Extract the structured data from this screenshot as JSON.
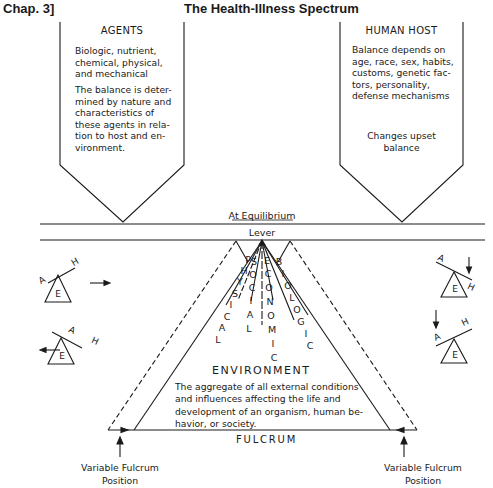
{
  "header": {
    "chapter": "Chap. 3]",
    "title": "The Health-Illness Spectrum"
  },
  "agents": {
    "title": "AGENTS",
    "text1": [
      "Biologic, nutrient,",
      "chemical, physical,",
      "and mechanical"
    ],
    "text2": [
      "The balance is deter-",
      "mined by nature and",
      "characteristics of",
      "these agents in rela-",
      "tion to host and en-",
      "vironment."
    ]
  },
  "host": {
    "title": "HUMAN HOST",
    "text1": [
      "Balance depends on",
      "age, race, sex, habits,",
      "customs, genetic fac-",
      "tors, personality,",
      "defense mechanisms"
    ],
    "text2": [
      "Changes upset",
      "balance"
    ]
  },
  "lever": {
    "equilibrium_label": "At Equilibrium",
    "lever_label": "Lever"
  },
  "factors": [
    {
      "name": "PHYSICAL",
      "letters": [
        "P",
        "H",
        "Y",
        "S",
        "I",
        "C",
        "A",
        "L"
      ]
    },
    {
      "name": "SOCIAL",
      "letters": [
        "S",
        "O",
        "C",
        "I",
        "A",
        "L"
      ]
    },
    {
      "name": "ECONOMIC",
      "letters": [
        "E",
        "C",
        "O",
        "N",
        "O",
        "M",
        "I",
        "C"
      ]
    },
    {
      "name": "BIOLOGIC",
      "letters": [
        "B",
        "I",
        "O",
        "L",
        "O",
        "G",
        "I",
        "C"
      ]
    }
  ],
  "environment": {
    "title": "ENVIRONMENT",
    "text": [
      "The aggregate of all external conditions",
      "and influences affecting the life and",
      "development of an organism, human be-",
      "havior, or society."
    ]
  },
  "fulcrum": {
    "label": "FULCRUM",
    "variable_left": [
      "Variable Fulcrum",
      "Position"
    ],
    "variable_right": [
      "Variable Fulcrum",
      "Position"
    ]
  },
  "mini_levers": {
    "agent_label": "A",
    "host_label": "H",
    "env_label": "E"
  },
  "colors": {
    "ink": "#1a1a1a",
    "background": "#ffffff"
  }
}
